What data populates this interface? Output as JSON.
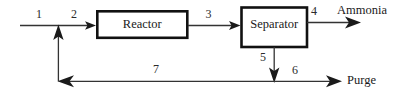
{
  "diagram": {
    "type": "process-flow-diagram",
    "units": [
      {
        "id": "reactor",
        "label": "Reactor"
      },
      {
        "id": "separator",
        "label": "Separator"
      }
    ],
    "streams": [
      {
        "id": "s1",
        "label": "1",
        "from": "feed",
        "to": "mixer"
      },
      {
        "id": "s2",
        "label": "2",
        "from": "mixer",
        "to": "reactor"
      },
      {
        "id": "s3",
        "label": "3",
        "from": "reactor",
        "to": "separator"
      },
      {
        "id": "s4",
        "label": "4",
        "from": "separator",
        "to": "ammonia-product"
      },
      {
        "id": "s5",
        "label": "5",
        "from": "separator",
        "to": "splitter"
      },
      {
        "id": "s6",
        "label": "6",
        "from": "splitter",
        "to": "purge"
      },
      {
        "id": "s7",
        "label": "7",
        "from": "splitter",
        "to": "mixer"
      }
    ],
    "io_labels": [
      {
        "id": "ammonia",
        "label": "Ammonia"
      },
      {
        "id": "purge",
        "label": "Purge"
      }
    ],
    "colors": {
      "background": "#ffffff",
      "box_stroke": "#111111",
      "line": "#333333",
      "text": "#1a1a1a"
    }
  }
}
